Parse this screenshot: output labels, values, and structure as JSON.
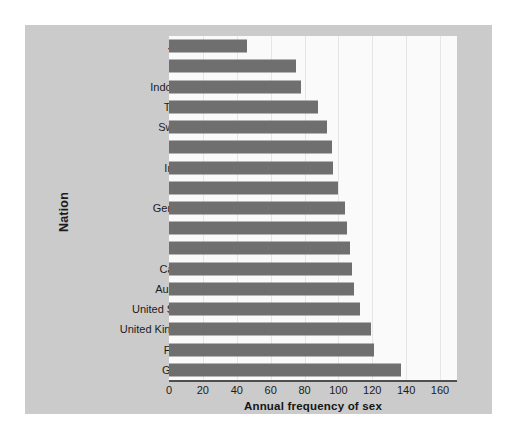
{
  "chart_data": {
    "type": "bar",
    "orientation": "horizontal",
    "title": "",
    "xlabel": "Annual frequency of sex",
    "ylabel": "Nation",
    "xlim": [
      0,
      170
    ],
    "xticks": [
      0,
      20,
      40,
      60,
      80,
      100,
      120,
      140,
      160
    ],
    "xtick_labels": [
      "0",
      "20",
      "40",
      "60",
      "80",
      "100",
      "120",
      "140",
      "160"
    ],
    "grid": true,
    "grid_axis": "x",
    "legend": null,
    "categories": [
      "Japan",
      "India",
      "Indonesia",
      "Taiwan",
      "Sweden",
      "China",
      "Ireland",
      "Israel",
      "Germany",
      "Spain",
      "Italy",
      "Canada",
      "Australia",
      "United  States",
      "United  Kingdom",
      "France",
      "Greece"
    ],
    "values": [
      46,
      75,
      78,
      88,
      93,
      96,
      97,
      100,
      104,
      105,
      107,
      108,
      109,
      113,
      119,
      121,
      137
    ],
    "bar_color": "#6f6f6f",
    "plot_background": "#fafafa",
    "panel_background": "#cbcbcb",
    "figure_background": "#ffffff",
    "text_color": "#1b1b1b"
  }
}
